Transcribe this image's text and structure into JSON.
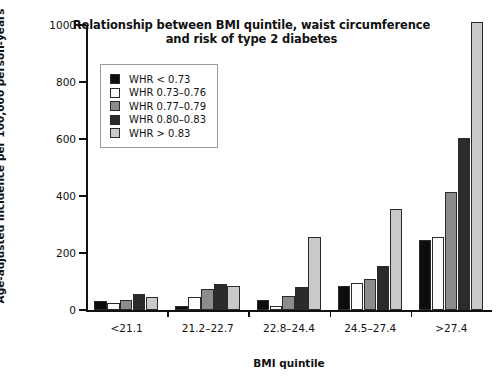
{
  "chart_data": {
    "type": "bar",
    "title_line1": "Relationship between BMI quintile, waist circumference",
    "title_line2": "and risk of type 2 diabetes",
    "xlabel": "BMI quintile",
    "ylabel": "Age-adjusted incidence per 100,000 person-years",
    "categories": [
      "<21.1",
      "21.2–22.7",
      "22.8–24.4",
      "24.5–27.4",
      ">27.4"
    ],
    "ylim": [
      0,
      1000
    ],
    "yticks": [
      0,
      200,
      400,
      600,
      800,
      1000
    ],
    "yticklabels": [
      "0",
      "200",
      "400",
      "600",
      "800",
      "1000"
    ],
    "grid": false,
    "legend_position": "upper left",
    "series": [
      {
        "name": "WHR < 0.73",
        "color": "#0d0d0d",
        "values": [
          30,
          15,
          35,
          85,
          245
        ]
      },
      {
        "name": "WHR 0.73–0.76",
        "color": "#fbfbfb",
        "values": [
          25,
          45,
          15,
          95,
          255
        ]
      },
      {
        "name": "WHR 0.77–0.79",
        "color": "#8c8c8c",
        "values": [
          35,
          75,
          50,
          110,
          415
        ]
      },
      {
        "name": "WHR 0.80–0.83",
        "color": "#2b2b2b",
        "values": [
          55,
          90,
          80,
          155,
          605
        ]
      },
      {
        "name": "WHR > 0.83",
        "color": "#c9c9c9",
        "values": [
          45,
          85,
          255,
          355,
          1010
        ]
      }
    ]
  }
}
